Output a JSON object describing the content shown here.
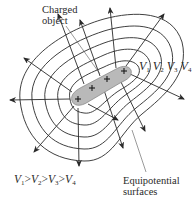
{
  "figure": {
    "type": "equipotential-diagram",
    "labels": {
      "charged_object": [
        "Charged",
        "object"
      ],
      "equipotential": [
        "Equipotential",
        "surfaces"
      ],
      "potentials": [
        {
          "sym": "V",
          "sub": "1"
        },
        {
          "sym": "V",
          "sub": "2"
        },
        {
          "sym": "V",
          "sub": "3"
        },
        {
          "sym": "V",
          "sub": "4"
        }
      ],
      "inequality": {
        "terms": [
          {
            "sym": "V",
            "sub": "1"
          },
          {
            "sym": "V",
            "sub": "2"
          },
          {
            "sym": "V",
            "sub": "3"
          },
          {
            "sym": "V",
            "sub": "4"
          }
        ],
        "op": ">"
      }
    },
    "charge_sign": "+",
    "charge_count": 4,
    "equipotential_ring_count": 5,
    "field_line_count": 12,
    "colors": {
      "line": "#2a2a2a",
      "object_fill": "#b9b9b9",
      "object_edge": "#8a8a8a",
      "background": "#ffffff"
    }
  }
}
